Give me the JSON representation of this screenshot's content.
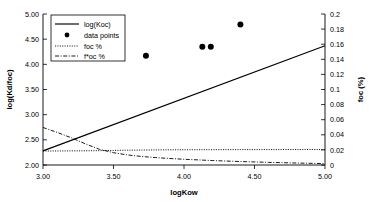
{
  "chart_data": {
    "type": "line",
    "title": "",
    "subtitle": "",
    "xlabel": "logKow",
    "ylabel": "log(Kd/foc)",
    "y2label": "foc (%)",
    "xlim": [
      3.0,
      5.0
    ],
    "ylim": [
      2.0,
      5.0
    ],
    "y2lim": [
      0,
      0.2
    ],
    "grid": false,
    "legend_position": "upper left",
    "xticks": [
      3.0,
      3.5,
      4.0,
      4.5,
      5.0
    ],
    "xticklabels": [
      "3.00",
      "3.50",
      "4.00",
      "4.50",
      "5.00"
    ],
    "yticks": [
      2.0,
      2.5,
      3.0,
      3.5,
      4.0,
      4.5,
      5.0
    ],
    "yticklabels": [
      "2.00",
      "2.50",
      "3.00",
      "3.50",
      "4.00",
      "4.50",
      "5.00"
    ],
    "y2ticks": [
      0,
      0.02,
      0.04,
      0.06,
      0.08,
      0.1,
      0.12,
      0.14,
      0.16,
      0.18,
      0.2
    ],
    "y2ticklabels": [
      "0",
      "0.02",
      "0.04",
      "0.06",
      "0.08",
      "0.1",
      "0.12",
      "0.14",
      "0.16",
      "0.18",
      "0.2"
    ],
    "series": [
      {
        "name": "log(Koc)",
        "style": "solid",
        "axis": "left",
        "x": [
          3.0,
          5.0
        ],
        "values": [
          2.28,
          4.37
        ]
      },
      {
        "name": "data points",
        "style": "marker",
        "axis": "left",
        "x": [
          3.73,
          4.13,
          4.19,
          4.4
        ],
        "values": [
          4.17,
          4.35,
          4.35,
          4.79
        ]
      },
      {
        "name": "foc %",
        "style": "dotted",
        "axis": "right",
        "x": [
          3.0,
          3.1,
          3.2,
          3.3,
          3.4,
          3.5,
          3.6,
          3.7,
          3.8,
          3.9,
          4.0,
          4.2,
          4.4,
          4.6,
          4.8,
          5.0
        ],
        "values": [
          0.0185,
          0.0186,
          0.0187,
          0.0188,
          0.019,
          0.0193,
          0.0196,
          0.0198,
          0.02,
          0.0201,
          0.0202,
          0.0203,
          0.0204,
          0.0204,
          0.0205,
          0.0205
        ]
      },
      {
        "name": "f*oc %",
        "style": "dash-dot",
        "axis": "right",
        "x": [
          3.0,
          3.1,
          3.2,
          3.3,
          3.4,
          3.5,
          3.6,
          3.7,
          3.8,
          3.9,
          4.0,
          4.2,
          4.4,
          4.6,
          4.8,
          5.0
        ],
        "values": [
          0.0497,
          0.0432,
          0.0361,
          0.0281,
          0.0208,
          0.0163,
          0.0133,
          0.0113,
          0.0098,
          0.0086,
          0.0076,
          0.0059,
          0.0046,
          0.0035,
          0.0026,
          0.0019
        ]
      }
    ],
    "legend_entries": [
      {
        "label": "log(Koc)",
        "style": "solid"
      },
      {
        "label": "data points",
        "style": "marker"
      },
      {
        "label": "foc %",
        "style": "dotted"
      },
      {
        "label": "f*oc %",
        "style": "dash-dot"
      }
    ],
    "colors": {
      "line": "#000000",
      "marker": "#000000",
      "axis": "#000000",
      "background": "#ffffff"
    }
  }
}
